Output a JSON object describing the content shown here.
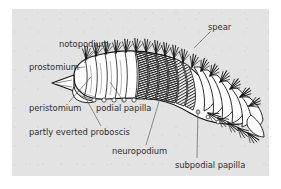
{
  "figure": {
    "type": "labeled-anatomical-illustration",
    "panel_background_color": "#e3e3e3",
    "page_background_color": "#ffffff",
    "ink_color": "#1a1a1a",
    "label_text_color": "#2e2e2e",
    "leader_line_color": "#555555",
    "labels": [
      {
        "id": "notopodium",
        "text": "notopodium",
        "x": 47,
        "y": 31,
        "align": "left",
        "leader": {
          "x1": 88,
          "y1": 36,
          "x2": 72,
          "y2": 54
        }
      },
      {
        "id": "prostomium",
        "text": "prostomium",
        "x": 17,
        "y": 54,
        "align": "left",
        "leader": {
          "x1": 62,
          "y1": 59,
          "x2": 73,
          "y2": 58
        }
      },
      {
        "id": "peristomium",
        "text": "peristomium",
        "x": 17,
        "y": 95,
        "align": "left",
        "leader": {
          "x1": 57,
          "y1": 93,
          "x2": 79,
          "y2": 68
        }
      },
      {
        "id": "partly-everted-proboscis",
        "text": "partly everted proboscis",
        "x": 17,
        "y": 119,
        "align": "left",
        "leader": {
          "x1": 89,
          "y1": 117,
          "x2": 72,
          "y2": 86
        }
      },
      {
        "id": "podial-papilla",
        "text": "podial papilla",
        "x": 84,
        "y": 95,
        "align": "left",
        "leader": {
          "x1": 112,
          "y1": 93,
          "x2": 98,
          "y2": 73
        }
      },
      {
        "id": "neuropodium",
        "text": "neuropodium",
        "x": 100,
        "y": 138,
        "align": "left",
        "leader": {
          "x1": 134,
          "y1": 136,
          "x2": 151,
          "y2": 79
        }
      },
      {
        "id": "subpodial-papilla",
        "text": "subpodial papilla",
        "x": 163,
        "y": 152,
        "align": "left",
        "leader": {
          "x1": 185,
          "y1": 149,
          "x2": 186,
          "y2": 100
        }
      },
      {
        "id": "spear",
        "text": "spear",
        "x": 196,
        "y": 14,
        "align": "left",
        "leader": {
          "x1": 199,
          "y1": 22,
          "x2": 182,
          "y2": 39
        }
      }
    ]
  }
}
